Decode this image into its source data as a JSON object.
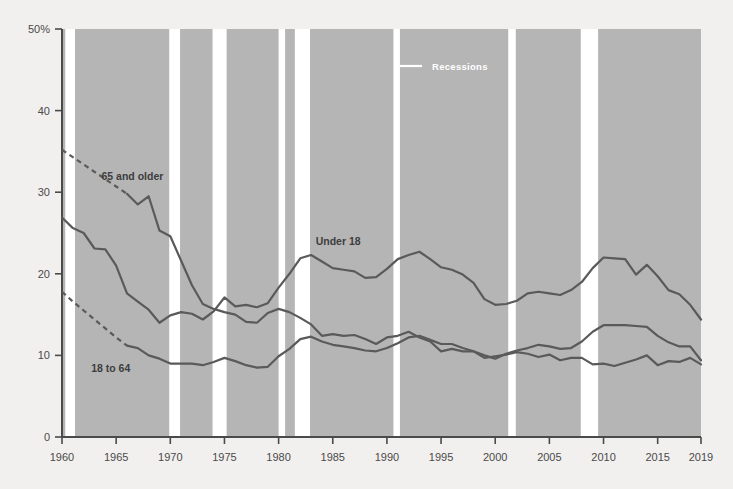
{
  "chart_data": {
    "type": "line",
    "title": "",
    "subtitle": "",
    "xlabel": "",
    "ylabel": "",
    "xlim": [
      1960,
      2019
    ],
    "ylim": [
      0,
      50
    ],
    "yticks": [
      0,
      10,
      20,
      30,
      40,
      50
    ],
    "ytick_labels": [
      "0",
      "10",
      "20",
      "30",
      "40",
      "50%"
    ],
    "xticks": [
      1960,
      1965,
      1970,
      1975,
      1980,
      1985,
      1990,
      1995,
      2000,
      2005,
      2010,
      2015,
      2019
    ],
    "xtick_labels": [
      "1960",
      "1965",
      "1970",
      "1975",
      "1980",
      "1985",
      "1990",
      "1995",
      "2000",
      "2005",
      "2010",
      "2015",
      "2019"
    ],
    "grid": false,
    "legend_position": "inside-top-center",
    "legend": [
      {
        "name": "Recessions",
        "marker": "line",
        "color": "#ffffff"
      }
    ],
    "band_color": "#b5b5b5",
    "background_color": "#f2f0ee",
    "line_color": "#5a5a5a",
    "series": [
      {
        "name": "65 and older",
        "label": "65 and older",
        "label_x": 1966.5,
        "label_y": 31.5,
        "dashed_until": 1966,
        "x": [
          1960,
          1961,
          1962,
          1963,
          1964,
          1965,
          1966,
          1967,
          1968,
          1969,
          1970,
          1971,
          1972,
          1973,
          1974,
          1975,
          1976,
          1977,
          1978,
          1979,
          1980,
          1981,
          1982,
          1983,
          1984,
          1985,
          1986,
          1987,
          1988,
          1989,
          1990,
          1991,
          1992,
          1993,
          1994,
          1995,
          1996,
          1997,
          1998,
          1999,
          2000,
          2001,
          2002,
          2003,
          2004,
          2005,
          2006,
          2007,
          2008,
          2009,
          2010,
          2011,
          2012,
          2013,
          2014,
          2015,
          2016,
          2017,
          2018,
          2019
        ],
        "y": [
          35.2,
          34.3,
          33.4,
          32.5,
          31.6,
          30.7,
          29.8,
          28.5,
          29.5,
          25.3,
          24.6,
          21.6,
          18.6,
          16.3,
          15.7,
          15.3,
          15.0,
          14.1,
          14.0,
          15.2,
          15.7,
          15.3,
          14.6,
          13.8,
          12.4,
          12.6,
          12.4,
          12.5,
          12.0,
          11.4,
          12.2,
          12.4,
          12.9,
          12.2,
          11.7,
          10.5,
          10.8,
          10.5,
          10.5,
          9.7,
          9.9,
          10.1,
          10.4,
          10.2,
          9.8,
          10.1,
          9.4,
          9.7,
          9.7,
          8.9,
          9.0,
          8.7,
          9.1,
          9.5,
          10.0,
          8.8,
          9.3,
          9.2,
          9.7,
          8.9
        ]
      },
      {
        "name": "18 to 64",
        "label": "18 to 64",
        "label_x": 1964.5,
        "label_y": 8.0,
        "dashed_until": 1966,
        "x": [
          1960,
          1961,
          1962,
          1963,
          1964,
          1965,
          1966,
          1967,
          1968,
          1969,
          1970,
          1971,
          1972,
          1973,
          1974,
          1975,
          1976,
          1977,
          1978,
          1979,
          1980,
          1981,
          1982,
          1983,
          1984,
          1985,
          1986,
          1987,
          1988,
          1989,
          1990,
          1991,
          1992,
          1993,
          1994,
          1995,
          1996,
          1997,
          1998,
          1999,
          2000,
          2001,
          2002,
          2003,
          2004,
          2005,
          2006,
          2007,
          2008,
          2009,
          2010,
          2011,
          2012,
          2013,
          2014,
          2015,
          2016,
          2017,
          2018,
          2019
        ],
        "y": [
          17.8,
          16.6,
          15.5,
          14.4,
          13.3,
          12.2,
          11.2,
          10.9,
          10.0,
          9.6,
          9.0,
          9.0,
          9.0,
          8.8,
          9.2,
          9.7,
          9.3,
          8.8,
          8.5,
          8.6,
          9.9,
          10.8,
          12.0,
          12.3,
          11.7,
          11.3,
          11.1,
          10.9,
          10.6,
          10.5,
          10.9,
          11.5,
          12.2,
          12.4,
          11.9,
          11.4,
          11.4,
          10.9,
          10.5,
          10.0,
          9.6,
          10.2,
          10.6,
          10.9,
          11.3,
          11.1,
          10.8,
          10.9,
          11.7,
          12.9,
          13.7,
          13.7,
          13.7,
          13.6,
          13.5,
          12.4,
          11.6,
          11.1,
          11.1,
          9.4
        ]
      },
      {
        "name": "Under 18",
        "label": "Under 18",
        "label_x": 1985.5,
        "label_y": 23.5,
        "dashed_until": null,
        "x": [
          1960,
          1961,
          1962,
          1963,
          1964,
          1965,
          1966,
          1967,
          1968,
          1969,
          1970,
          1971,
          1972,
          1973,
          1974,
          1975,
          1976,
          1977,
          1978,
          1979,
          1980,
          1981,
          1982,
          1983,
          1984,
          1985,
          1986,
          1987,
          1988,
          1989,
          1990,
          1991,
          1992,
          1993,
          1994,
          1995,
          1996,
          1997,
          1998,
          1999,
          2000,
          2001,
          2002,
          2003,
          2004,
          2005,
          2006,
          2007,
          2008,
          2009,
          2010,
          2011,
          2012,
          2013,
          2014,
          2015,
          2016,
          2017,
          2018,
          2019
        ],
        "y": [
          26.9,
          25.6,
          25.0,
          23.1,
          23.0,
          21.0,
          17.6,
          16.6,
          15.6,
          14.0,
          14.9,
          15.3,
          15.1,
          14.4,
          15.4,
          17.1,
          16.0,
          16.2,
          15.9,
          16.4,
          18.3,
          20.0,
          21.9,
          22.3,
          21.5,
          20.7,
          20.5,
          20.3,
          19.5,
          19.6,
          20.6,
          21.8,
          22.3,
          22.7,
          21.8,
          20.8,
          20.5,
          19.9,
          18.9,
          16.9,
          16.2,
          16.3,
          16.7,
          17.6,
          17.8,
          17.6,
          17.4,
          18.0,
          19.0,
          20.7,
          22.0,
          21.9,
          21.8,
          19.9,
          21.1,
          19.7,
          18.0,
          17.5,
          16.2,
          14.4
        ]
      }
    ],
    "recessions": [
      {
        "start": 1960.3,
        "end": 1961.2
      },
      {
        "start": 1969.9,
        "end": 1970.9
      },
      {
        "start": 1973.9,
        "end": 1975.2
      },
      {
        "start": 1980.0,
        "end": 1980.6
      },
      {
        "start": 1981.5,
        "end": 1982.9
      },
      {
        "start": 1990.6,
        "end": 1991.2
      },
      {
        "start": 2001.2,
        "end": 2001.9
      },
      {
        "start": 2007.9,
        "end": 2009.5
      }
    ]
  }
}
